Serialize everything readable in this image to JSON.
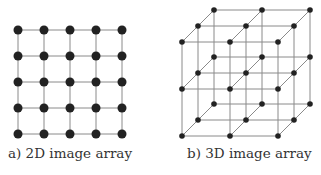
{
  "panels": [
    {
      "id": "a",
      "caption": "a) 2D image array",
      "type": "2d-grid",
      "rows": 5,
      "cols": 5,
      "origin": [
        18,
        30
      ],
      "spacing": [
        26,
        26
      ],
      "node_radius": 4.5
    },
    {
      "id": "b",
      "caption": "b) 3D image array",
      "type": "3d-lattice",
      "size": [
        3,
        3,
        3
      ],
      "front_origin": [
        182,
        42
      ],
      "spacing": [
        48,
        47
      ],
      "depth_step": [
        16,
        -16
      ],
      "node_radius": 2.8
    }
  ],
  "colors": {
    "node": "#222222",
    "edge": "#8a8a8a",
    "caption": "#333333",
    "background": "#ffffff"
  }
}
